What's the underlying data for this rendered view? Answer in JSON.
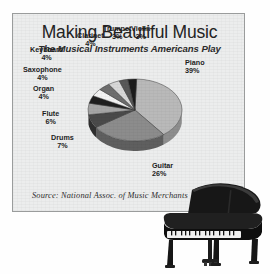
{
  "panel": {
    "title": "Making Beautiful Music",
    "subtitle": "The Musical Instruments Americans Play",
    "source": "Source:  National Assoc. of Music Merchants",
    "background_color": "#eceded",
    "border_color": "#9a9c9c"
  },
  "photo": {
    "name": "grand-piano-photo",
    "alt": "Grand piano"
  },
  "chart_data": {
    "type": "pie",
    "title": "Making Beautiful Music",
    "subtitle": "The Musical Instruments Americans Play",
    "source": "Source:  National Assoc. of Music Merchants",
    "unit": "%",
    "three_d": true,
    "categories": [
      "Piano",
      "Guitar",
      "Drums",
      "Flute",
      "Organ",
      "Saxophone",
      "Keyboard",
      "Clarinet",
      "Trumpet",
      "Violin"
    ],
    "values": [
      39,
      26,
      7,
      6,
      4,
      4,
      4,
      4,
      3,
      3
    ],
    "slices": [
      {
        "label": "Piano",
        "pct_text": "39%",
        "value": 39,
        "color": "#b9b9b9",
        "side_color": "#8e8e8e"
      },
      {
        "label": "Guitar",
        "pct_text": "26%",
        "value": 26,
        "color": "#8c8c8c",
        "side_color": "#5f5f5f"
      },
      {
        "label": "Drums",
        "pct_text": "7%",
        "value": 7,
        "color": "#4a4a4a",
        "side_color": "#2f2f2f"
      },
      {
        "label": "Flute",
        "pct_text": "6%",
        "value": 6,
        "color": "#a6a6a6",
        "side_color": "#7a7a7a"
      },
      {
        "label": "Organ",
        "pct_text": "4%",
        "value": 4,
        "color": "#1f1f1f",
        "side_color": "#141414"
      },
      {
        "label": "Saxophone",
        "pct_text": "4%",
        "value": 4,
        "color": "#f2f2f2",
        "side_color": "#c2c2c2"
      },
      {
        "label": "Keyboard",
        "pct_text": "4%",
        "value": 4,
        "color": "#6e6e6e",
        "side_color": "#4a4a4a"
      },
      {
        "label": "Clarinet",
        "pct_text": "4%",
        "value": 4,
        "color": "#d8d8d8",
        "side_color": "#ababab"
      },
      {
        "label": "Trumpet",
        "pct_text": "3%",
        "value": 3,
        "color": "#585858",
        "side_color": "#3a3a3a"
      },
      {
        "label": "Violin",
        "pct_text": "3%",
        "value": 3,
        "color": "#1c1c1c",
        "side_color": "#101010"
      }
    ],
    "legend": "labels-with-leader-placement",
    "grid": false
  }
}
